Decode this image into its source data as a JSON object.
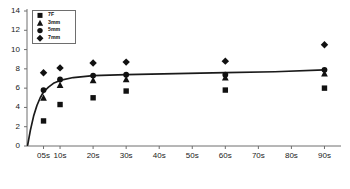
{
  "chart_data": {
    "type": "scatter",
    "title": "",
    "xlabel": "",
    "ylabel": "",
    "xlim": [
      0,
      95
    ],
    "ylim": [
      0,
      14
    ],
    "grid": false,
    "legend_position": "top-left",
    "x_tick_labels": [
      "05s",
      "10s",
      "20s",
      "30s",
      "40s",
      "50s",
      "60s",
      "70s",
      "80s",
      "90s"
    ],
    "x_tick_values": [
      5,
      10,
      20,
      30,
      40,
      50,
      60,
      70,
      80,
      90
    ],
    "y_tick_labels": [
      "0",
      "2",
      "4",
      "6",
      "8",
      "10",
      "12",
      "14"
    ],
    "y_tick_values": [
      0,
      2,
      4,
      6,
      8,
      10,
      12,
      14
    ],
    "series": [
      {
        "name": "7F",
        "marker": "square",
        "color": "#111111",
        "points": [
          {
            "x": 5,
            "y": 2.6
          },
          {
            "x": 10,
            "y": 4.3
          },
          {
            "x": 20,
            "y": 5.0
          },
          {
            "x": 30,
            "y": 5.7
          },
          {
            "x": 60,
            "y": 5.8
          },
          {
            "x": 90,
            "y": 6.0
          }
        ]
      },
      {
        "name": "3mm",
        "marker": "triangle",
        "color": "#111111",
        "points": [
          {
            "x": 5,
            "y": 5.0
          },
          {
            "x": 10,
            "y": 6.3
          },
          {
            "x": 20,
            "y": 6.8
          },
          {
            "x": 30,
            "y": 6.9
          },
          {
            "x": 60,
            "y": 7.1
          },
          {
            "x": 90,
            "y": 7.5
          }
        ]
      },
      {
        "name": "5mm",
        "marker": "circle",
        "color": "#111111",
        "points": [
          {
            "x": 5,
            "y": 5.8
          },
          {
            "x": 10,
            "y": 6.9
          },
          {
            "x": 20,
            "y": 7.3
          },
          {
            "x": 30,
            "y": 7.4
          },
          {
            "x": 60,
            "y": 7.4
          },
          {
            "x": 90,
            "y": 7.9
          }
        ]
      },
      {
        "name": "7mm",
        "marker": "diamond",
        "color": "#111111",
        "points": [
          {
            "x": 5,
            "y": 7.6
          },
          {
            "x": 10,
            "y": 8.1
          },
          {
            "x": 20,
            "y": 8.6
          },
          {
            "x": 30,
            "y": 8.7
          },
          {
            "x": 60,
            "y": 8.8
          },
          {
            "x": 90,
            "y": 10.5
          }
        ]
      }
    ],
    "fit_curve": {
      "name": "fitted-trend",
      "color": "#1a1a1a",
      "points": [
        {
          "x": 0.2,
          "y": 0.1
        },
        {
          "x": 1.0,
          "y": 1.6
        },
        {
          "x": 2.0,
          "y": 3.1
        },
        {
          "x": 3.0,
          "y": 4.2
        },
        {
          "x": 4.0,
          "y": 5.0
        },
        {
          "x": 5.0,
          "y": 5.6
        },
        {
          "x": 6.5,
          "y": 6.1
        },
        {
          "x": 8.0,
          "y": 6.5
        },
        {
          "x": 10.0,
          "y": 6.8
        },
        {
          "x": 14.0,
          "y": 7.1
        },
        {
          "x": 20.0,
          "y": 7.3
        },
        {
          "x": 30.0,
          "y": 7.4
        },
        {
          "x": 45.0,
          "y": 7.5
        },
        {
          "x": 60.0,
          "y": 7.6
        },
        {
          "x": 75.0,
          "y": 7.7
        },
        {
          "x": 90.0,
          "y": 7.9
        }
      ]
    },
    "legend_entries": [
      {
        "label": "7F",
        "marker": "square"
      },
      {
        "label": "3mm",
        "marker": "triangle"
      },
      {
        "label": "5mm",
        "marker": "circle"
      },
      {
        "label": "7mm",
        "marker": "diamond"
      }
    ]
  }
}
